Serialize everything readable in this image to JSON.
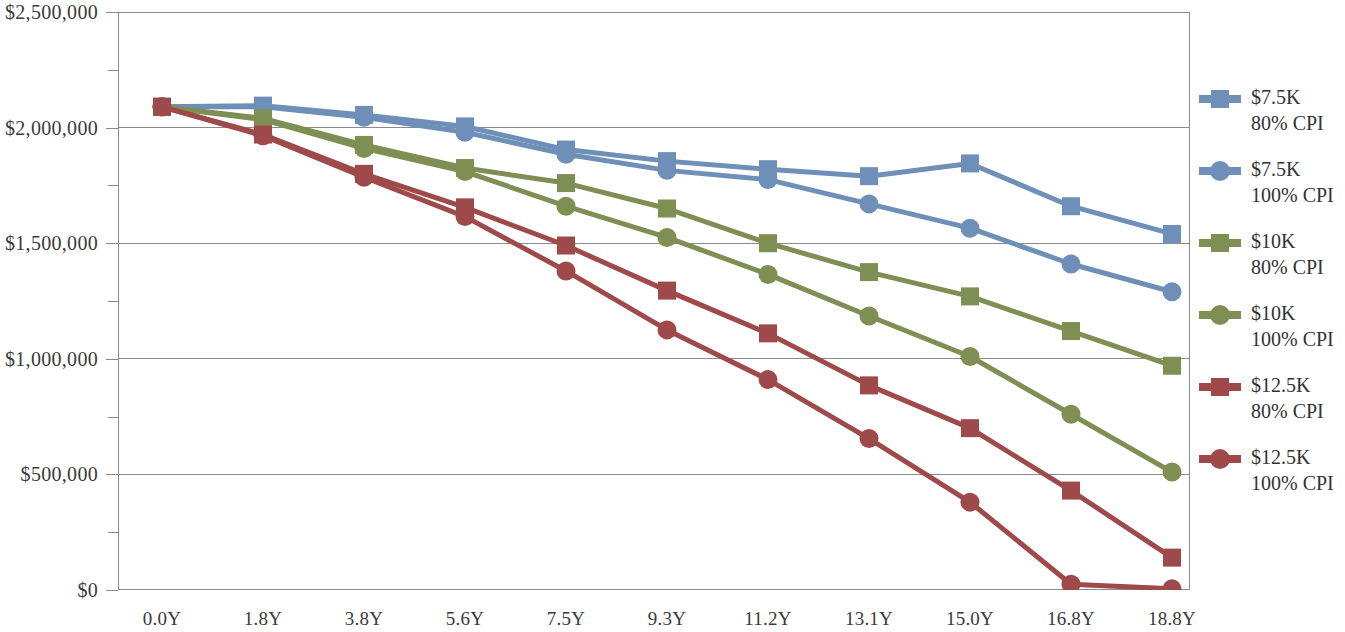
{
  "chart_data": {
    "type": "line",
    "title": "",
    "subtitle": "",
    "xlabel": "",
    "ylabel": "",
    "grid": true,
    "legend_position": "right",
    "x": [
      "0.0Y",
      "1.8Y",
      "3.8Y",
      "5.6Y",
      "7.5Y",
      "9.3Y",
      "11.2Y",
      "13.1Y",
      "15.0Y",
      "16.8Y",
      "18.8Y"
    ],
    "categories": [
      "0.0Y",
      "1.8Y",
      "3.8Y",
      "5.6Y",
      "7.5Y",
      "9.3Y",
      "11.2Y",
      "13.1Y",
      "15.0Y",
      "16.8Y",
      "18.8Y"
    ],
    "ylim": [
      0,
      2500000
    ],
    "ytick_values": [
      0,
      500000,
      1000000,
      1500000,
      2000000,
      2500000
    ],
    "ytick_labels": [
      "$0",
      "$500,000",
      "$1,000,000",
      "$1,500,000",
      "$2,000,000",
      "$2,500,000"
    ],
    "yminor_values": [
      250000,
      750000,
      1250000,
      1750000,
      2250000
    ],
    "series": [
      {
        "name": "$7.5K 80% CPI",
        "label_line1": "$7.5K",
        "label_line2": "80% CPI",
        "color": "#6E8FB8",
        "marker": "square",
        "values": [
          2090000,
          2095000,
          2055000,
          2005000,
          1905000,
          1855000,
          1820000,
          1790000,
          1845000,
          1660000,
          1540000
        ]
      },
      {
        "name": "$7.5K 100% CPI",
        "label_line1": "$7.5K",
        "label_line2": "100% CPI",
        "color": "#6E8FB8",
        "marker": "circle",
        "values": [
          2090000,
          2090000,
          2045000,
          1980000,
          1885000,
          1815000,
          1775000,
          1670000,
          1565000,
          1410000,
          1290000
        ]
      },
      {
        "name": "$10K 80% CPI",
        "label_line1": "$10K",
        "label_line2": "80% CPI",
        "color": "#7F8E52",
        "marker": "square",
        "values": [
          2090000,
          2040000,
          1925000,
          1825000,
          1760000,
          1650000,
          1500000,
          1375000,
          1270000,
          1120000,
          970000
        ]
      },
      {
        "name": "$10K 100% CPI",
        "label_line1": "$10K",
        "label_line2": "100% CPI",
        "color": "#7F8E52",
        "marker": "circle",
        "values": [
          2090000,
          2035000,
          1910000,
          1810000,
          1660000,
          1525000,
          1365000,
          1185000,
          1010000,
          760000,
          510000
        ]
      },
      {
        "name": "$12.5K 80% CPI",
        "label_line1": "$12.5K",
        "label_line2": "80% CPI",
        "color": "#9E4A4A",
        "marker": "square",
        "values": [
          2090000,
          1970000,
          1800000,
          1655000,
          1490000,
          1295000,
          1110000,
          885000,
          700000,
          430000,
          140000
        ]
      },
      {
        "name": "$12.5K 100% CPI",
        "label_line1": "$12.5K",
        "label_line2": "100% CPI",
        "color": "#9E4A4A",
        "marker": "circle",
        "values": [
          2090000,
          1965000,
          1785000,
          1615000,
          1380000,
          1125000,
          910000,
          655000,
          380000,
          25000,
          5000
        ]
      }
    ]
  },
  "axes": {
    "y_labels": [
      "$2,500,000",
      "$2,000,000",
      "$1,500,000",
      "$1,000,000",
      "$500,000",
      "$0"
    ],
    "x_labels": [
      "0.0Y",
      "1.8Y",
      "3.8Y",
      "5.6Y",
      "7.5Y",
      "9.3Y",
      "11.2Y",
      "13.1Y",
      "15.0Y",
      "16.8Y",
      "18.8Y"
    ]
  },
  "legend": {
    "items": [
      {
        "label_line1": "$7.5K",
        "label_line2": "80% CPI",
        "color": "#6E8FB8",
        "marker": "square"
      },
      {
        "label_line1": "$7.5K",
        "label_line2": "100% CPI",
        "color": "#6E8FB8",
        "marker": "circle"
      },
      {
        "label_line1": "$10K",
        "label_line2": "80% CPI",
        "color": "#7F8E52",
        "marker": "square"
      },
      {
        "label_line1": "$10K",
        "label_line2": "100% CPI",
        "color": "#7F8E52",
        "marker": "circle"
      },
      {
        "label_line1": "$12.5K",
        "label_line2": "80% CPI",
        "color": "#9E4A4A",
        "marker": "square"
      },
      {
        "label_line1": "$12.5K",
        "label_line2": "100% CPI",
        "color": "#9E4A4A",
        "marker": "circle"
      }
    ]
  },
  "style": {
    "grid_color": "#8a8a8a",
    "axis_color": "#8a8a8a",
    "plot_background": "#ffffff",
    "text_color": "#3a3a3a"
  }
}
